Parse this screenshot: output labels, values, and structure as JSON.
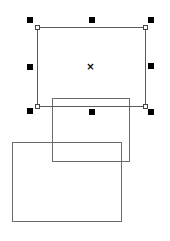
{
  "canvas": {
    "width": 170,
    "height": 241,
    "background": "#ffffff"
  },
  "shapes": [
    {
      "id": "rect-selected",
      "type": "rectangle",
      "selected": true,
      "x": 37,
      "y": 27,
      "width": 109,
      "height": 80,
      "stroke": "#5a5a5a"
    },
    {
      "id": "rect-middle",
      "type": "rectangle",
      "selected": false,
      "x": 52,
      "y": 98,
      "width": 78,
      "height": 64,
      "stroke": "#6a6a6a"
    },
    {
      "id": "rect-bottom",
      "type": "rectangle",
      "selected": false,
      "x": 12,
      "y": 142,
      "width": 110,
      "height": 80,
      "stroke": "#6a6a6a"
    }
  ],
  "selection": {
    "center_mark": "×",
    "handle_color": "#000000",
    "handles": [
      {
        "pos": "top-left",
        "x": 27,
        "y": 17
      },
      {
        "pos": "top-middle",
        "x": 89,
        "y": 17
      },
      {
        "pos": "top-right",
        "x": 148,
        "y": 17
      },
      {
        "pos": "middle-left",
        "x": 27,
        "y": 64
      },
      {
        "pos": "middle-right",
        "x": 148,
        "y": 63
      },
      {
        "pos": "bottom-left",
        "x": 27,
        "y": 108
      },
      {
        "pos": "bottom-middle",
        "x": 89,
        "y": 109
      },
      {
        "pos": "bottom-right",
        "x": 148,
        "y": 109
      }
    ]
  }
}
